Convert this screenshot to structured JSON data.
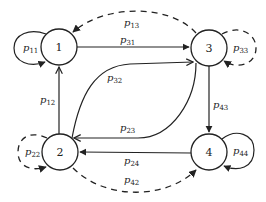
{
  "diagram": {
    "type": "state-transition-graph",
    "nodes": [
      {
        "id": "1",
        "label": "1"
      },
      {
        "id": "2",
        "label": "2"
      },
      {
        "id": "3",
        "label": "3"
      },
      {
        "id": "4",
        "label": "4"
      }
    ],
    "edges": [
      {
        "from": "1",
        "to": "1",
        "label": "p",
        "sub": "11",
        "style": "solid"
      },
      {
        "from": "1",
        "to": "3",
        "label": "p",
        "sub": "31",
        "style": "solid"
      },
      {
        "from": "3",
        "to": "1",
        "label": "p",
        "sub": "13",
        "style": "dashed"
      },
      {
        "from": "3",
        "to": "3",
        "label": "p",
        "sub": "33",
        "style": "dashed"
      },
      {
        "from": "2",
        "to": "1",
        "label": "p",
        "sub": "12",
        "style": "solid"
      },
      {
        "from": "2",
        "to": "3",
        "label": "p",
        "sub": "32",
        "style": "solid"
      },
      {
        "from": "3",
        "to": "2",
        "label": "p",
        "sub": "23",
        "style": "solid"
      },
      {
        "from": "3",
        "to": "4",
        "label": "p",
        "sub": "43",
        "style": "solid"
      },
      {
        "from": "2",
        "to": "2",
        "label": "p",
        "sub": "22",
        "style": "dashed"
      },
      {
        "from": "4",
        "to": "2",
        "label": "p",
        "sub": "24",
        "style": "solid"
      },
      {
        "from": "2",
        "to": "4",
        "label": "p",
        "sub": "42",
        "style": "dashed"
      },
      {
        "from": "4",
        "to": "4",
        "label": "p",
        "sub": "44",
        "style": "solid"
      }
    ]
  },
  "labels": {
    "n1": "1",
    "n2": "2",
    "n3": "3",
    "n4": "4",
    "p_main": "p",
    "s11": "11",
    "s31": "31",
    "s13": "13",
    "s33": "33",
    "s12": "12",
    "s32": "32",
    "s23": "23",
    "s43": "43",
    "s22": "22",
    "s24": "24",
    "s42": "42",
    "s44": "44"
  }
}
